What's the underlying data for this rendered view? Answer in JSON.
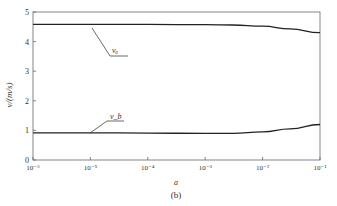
{
  "chart_data": {
    "type": "line",
    "title": "",
    "caption": "(b)",
    "xlabel": "a",
    "ylabel": "v/(m/s)",
    "xscale": "log",
    "xlim": [
      1e-06,
      0.1
    ],
    "ylim": [
      0,
      5
    ],
    "x_ticks": [
      "10⁻⁶",
      "10⁻⁵",
      "10⁻⁴",
      "10⁻³",
      "10⁻²",
      "10⁻¹"
    ],
    "y_ticks": [
      "0",
      "1",
      "2",
      "3",
      "4",
      "5"
    ],
    "grid": false,
    "legend": "inline annotations",
    "series": [
      {
        "name": "v_a",
        "label": "vₐ",
        "x": [
          1e-06,
          1e-05,
          0.0001,
          0.001,
          0.003,
          0.01,
          0.03,
          0.1
        ],
        "values": [
          4.58,
          4.58,
          4.58,
          4.57,
          4.56,
          4.52,
          4.43,
          4.3
        ]
      },
      {
        "name": "v_b",
        "label": "v_b",
        "x": [
          1e-06,
          1e-05,
          0.0001,
          0.001,
          0.003,
          0.01,
          0.03,
          0.1
        ],
        "values": [
          0.92,
          0.92,
          0.91,
          0.9,
          0.9,
          0.95,
          1.05,
          1.2
        ]
      }
    ]
  }
}
